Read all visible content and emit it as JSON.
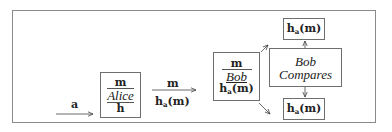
{
  "diagram": {
    "input_arrow": {
      "label": "a"
    },
    "alice_box": {
      "top": "m",
      "name": "Alice",
      "bottom_var": "h"
    },
    "transmit_arrow": {
      "label_top": "m",
      "label_bottom_func": "h",
      "label_bottom_sub": "a",
      "label_bottom_arg": "(m)"
    },
    "bob_box": {
      "top": "m",
      "name": "Bob",
      "bottom_func": "h",
      "bottom_sub": "a",
      "bottom_arg": "(m)"
    },
    "compare_box": {
      "line1": "Bob",
      "line2": "Compares"
    },
    "hash_top": {
      "func": "h",
      "sub": "a",
      "arg": "(m)"
    },
    "hash_bottom": {
      "func": "h",
      "sub": "a",
      "arg": "(m)"
    }
  }
}
